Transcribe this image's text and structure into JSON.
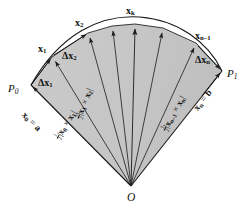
{
  "figure": {
    "colors": {
      "background": "#ffffff",
      "sector_fill": "#c8c8c8",
      "sector_fill_dark": "#bdbdbd",
      "stroke": "#1a1a1a",
      "label": "#111111"
    },
    "geometry": {
      "origin": {
        "x": 131,
        "y": 186,
        "label": "O"
      },
      "curve_points": [
        {
          "name": "P0",
          "x": 31,
          "y": 85
        },
        {
          "name": "x1",
          "x": 52,
          "y": 57
        },
        {
          "name": "x2",
          "x": 88,
          "y": 33
        },
        {
          "name": "xk",
          "x": 135,
          "y": 24
        },
        {
          "name": "xn-1",
          "x": 196,
          "y": 43
        },
        {
          "name": "P1",
          "x": 222,
          "y": 71
        }
      ]
    }
  },
  "labels": {
    "origin": "O",
    "p0": "P",
    "p0_sub": "0",
    "p1": "P",
    "p1_sub": "1",
    "x1": "x",
    "x1_sub": "1",
    "x2": "x",
    "x2_sub": "2",
    "xk": "x",
    "xk_sub": "k",
    "xn1": "x",
    "xn1_sub": "n–1",
    "dx1": "Δx",
    "dx1_sub": "1",
    "dx2": "Δx",
    "dx2_sub": "2",
    "dxn": "Δx",
    "dxn_sub": "n",
    "x0_eq_a_vec": "x",
    "x0_eq_a_sub": "0",
    "x0_eq_a_rest": " = ",
    "x0_eq_a_val": "a",
    "xn_eq_b_vec": "x",
    "xn_eq_b_sub": "n",
    "xn_eq_b_rest": " = ",
    "xn_eq_b_val": "b",
    "area0_num": "1",
    "area0_den": "2",
    "area0_open": "|",
    "area0_v1": "x",
    "area0_v1_sub": "0",
    "area0_times": " × ",
    "area0_v2": "x",
    "area0_v2_sub": "1",
    "area0_close": "|",
    "area1_num": "1",
    "area1_den": "2",
    "area1_open": "|",
    "area1_v1": "x",
    "area1_v1_sub": "1",
    "area1_times": " × ",
    "area1_v2": "x",
    "area1_v2_sub": "2",
    "area1_close": "|",
    "arean_num": "1",
    "arean_den": "2",
    "arean_open": "|",
    "arean_v1": "x",
    "arean_v1_sub": "n–1",
    "arean_times": " × ",
    "arean_v2": "x",
    "arean_v2_sub": "n",
    "arean_close": "|"
  }
}
